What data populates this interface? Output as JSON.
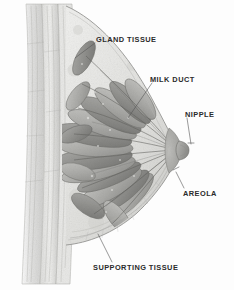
{
  "figure": {
    "style": "grayscale anatomical pencil illustration",
    "background_color": "#fdfdfd",
    "label_color": "#2b2b2b",
    "leader_line_color": "#555555",
    "width": 234,
    "height": 290
  },
  "labels": [
    {
      "id": "gland-tissue",
      "text": "GLAND TISSUE"
    },
    {
      "id": "milk-duct",
      "text": "MILK DUCT"
    },
    {
      "id": "nipple",
      "text": "NIPPLE"
    },
    {
      "id": "areola",
      "text": "AREOLA"
    },
    {
      "id": "supporting-tissue",
      "text": "SUPPORTING TISSUE"
    }
  ],
  "structures": {
    "chest_wall": "vertical layered muscle and rib wall at left",
    "gland_lobules": "elongated radiating lobules filling the breast",
    "ducts": "thin ducts converging toward the nipple",
    "nipple": "protruding tip at right edge of breast",
    "areola": "shaded region surrounding the nipple base",
    "supporting_tissue": "connective tissue along the lower breast contour"
  }
}
